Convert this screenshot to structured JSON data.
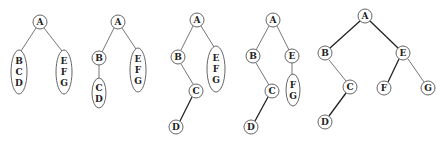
{
  "diagram": {
    "trees": [
      {
        "step": 1,
        "nodes": [
          {
            "id": "A",
            "label": "A",
            "x": 40,
            "y": 22
          }
        ],
        "groups": [
          {
            "labels": [
              "B",
              "C",
              "D"
            ],
            "cx": 19,
            "cy": 72,
            "rx": 8,
            "ry": 22
          },
          {
            "labels": [
              "E",
              "F",
              "G"
            ],
            "cx": 64,
            "cy": 72,
            "rx": 8,
            "ry": 22
          }
        ],
        "edges": [
          {
            "x1": 36,
            "y1": 28,
            "x2": 21,
            "y2": 51,
            "dark": false
          },
          {
            "x1": 44,
            "y1": 28,
            "x2": 62,
            "y2": 51,
            "dark": false
          }
        ]
      },
      {
        "step": 2,
        "nodes": [
          {
            "id": "A",
            "label": "A",
            "x": 118,
            "y": 22
          },
          {
            "id": "B",
            "label": "B",
            "x": 99,
            "y": 58
          }
        ],
        "groups": [
          {
            "labels": [
              "C",
              "D"
            ],
            "cx": 99,
            "cy": 93,
            "rx": 7,
            "ry": 15
          },
          {
            "labels": [
              "E",
              "F",
              "G"
            ],
            "cx": 138,
            "cy": 70,
            "rx": 8,
            "ry": 22
          }
        ],
        "edges": [
          {
            "x1": 114,
            "y1": 28,
            "x2": 102,
            "y2": 52,
            "dark": false
          },
          {
            "x1": 122,
            "y1": 28,
            "x2": 136,
            "y2": 49,
            "dark": false
          },
          {
            "x1": 99,
            "y1": 65,
            "x2": 99,
            "y2": 79,
            "dark": false
          }
        ]
      },
      {
        "step": 3,
        "nodes": [
          {
            "id": "A",
            "label": "A",
            "x": 197,
            "y": 20
          },
          {
            "id": "B",
            "label": "B",
            "x": 178,
            "y": 57
          },
          {
            "id": "C",
            "label": "C",
            "x": 196,
            "y": 91
          },
          {
            "id": "D",
            "label": "D",
            "x": 176,
            "y": 127
          }
        ],
        "groups": [
          {
            "labels": [
              "E",
              "F",
              "G"
            ],
            "cx": 216,
            "cy": 69,
            "rx": 9,
            "ry": 23
          }
        ],
        "edges": [
          {
            "x1": 193,
            "y1": 26,
            "x2": 181,
            "y2": 50,
            "dark": false
          },
          {
            "x1": 201,
            "y1": 26,
            "x2": 214,
            "y2": 47,
            "dark": false
          },
          {
            "x1": 181,
            "y1": 64,
            "x2": 193,
            "y2": 84,
            "dark": false
          },
          {
            "x1": 192,
            "y1": 97,
            "x2": 180,
            "y2": 121,
            "dark": true
          }
        ]
      },
      {
        "step": 4,
        "nodes": [
          {
            "id": "A",
            "label": "A",
            "x": 273,
            "y": 20
          },
          {
            "id": "B",
            "label": "B",
            "x": 253,
            "y": 56
          },
          {
            "id": "E",
            "label": "E",
            "x": 292,
            "y": 56
          },
          {
            "id": "C",
            "label": "C",
            "x": 272,
            "y": 91
          },
          {
            "id": "D",
            "label": "D",
            "x": 251,
            "y": 127
          }
        ],
        "groups": [
          {
            "labels": [
              "F",
              "G"
            ],
            "cx": 293,
            "cy": 90,
            "rx": 7,
            "ry": 16
          }
        ],
        "edges": [
          {
            "x1": 269,
            "y1": 26,
            "x2": 256,
            "y2": 50,
            "dark": false
          },
          {
            "x1": 277,
            "y1": 26,
            "x2": 289,
            "y2": 50,
            "dark": false
          },
          {
            "x1": 256,
            "y1": 63,
            "x2": 269,
            "y2": 85,
            "dark": false
          },
          {
            "x1": 292,
            "y1": 63,
            "x2": 292,
            "y2": 75,
            "dark": false
          },
          {
            "x1": 268,
            "y1": 97,
            "x2": 255,
            "y2": 121,
            "dark": true
          }
        ]
      },
      {
        "step": 5,
        "nodes": [
          {
            "id": "A",
            "label": "A",
            "x": 365,
            "y": 16
          },
          {
            "id": "B",
            "label": "B",
            "x": 325,
            "y": 53
          },
          {
            "id": "E",
            "label": "E",
            "x": 403,
            "y": 53
          },
          {
            "id": "C",
            "label": "C",
            "x": 350,
            "y": 87
          },
          {
            "id": "F",
            "label": "F",
            "x": 384,
            "y": 88
          },
          {
            "id": "G",
            "label": "G",
            "x": 428,
            "y": 88
          },
          {
            "id": "D",
            "label": "D",
            "x": 325,
            "y": 122
          }
        ],
        "groups": [],
        "edges": [
          {
            "x1": 360,
            "y1": 21,
            "x2": 330,
            "y2": 48,
            "dark": true
          },
          {
            "x1": 370,
            "y1": 21,
            "x2": 398,
            "y2": 48,
            "dark": true
          },
          {
            "x1": 329,
            "y1": 60,
            "x2": 346,
            "y2": 81,
            "dark": false
          },
          {
            "x1": 399,
            "y1": 59,
            "x2": 388,
            "y2": 82,
            "dark": true
          },
          {
            "x1": 408,
            "y1": 59,
            "x2": 424,
            "y2": 82,
            "dark": false
          },
          {
            "x1": 346,
            "y1": 93,
            "x2": 329,
            "y2": 116,
            "dark": true
          }
        ]
      }
    ]
  }
}
